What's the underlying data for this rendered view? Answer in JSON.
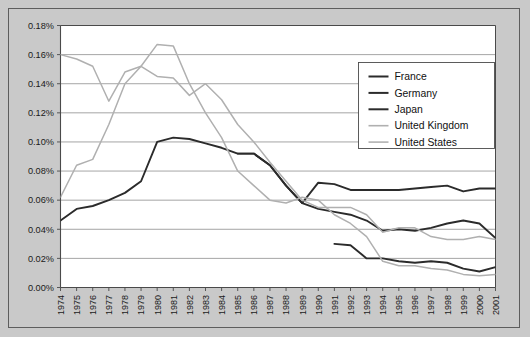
{
  "chart_data": {
    "type": "line",
    "title": "",
    "xlabel": "",
    "ylabel": "",
    "grid": true,
    "legend_position": "top-right",
    "x": [
      1974,
      1975,
      1976,
      1977,
      1978,
      1979,
      1980,
      1981,
      1982,
      1983,
      1984,
      1985,
      1986,
      1987,
      1988,
      1989,
      1990,
      1991,
      1992,
      1993,
      1994,
      1995,
      1996,
      1997,
      1998,
      1999,
      2000,
      2001
    ],
    "xtick_labels": [
      "1974",
      "1975",
      "1976",
      "1977",
      "1978",
      "1979",
      "1980",
      "1981",
      "1982",
      "1983",
      "1984",
      "1985",
      "1986",
      "1987",
      "1988",
      "1989",
      "1990",
      "1991",
      "1992",
      "1993",
      "1994",
      "1995",
      "1996",
      "1997",
      "1998",
      "1999",
      "2000",
      "2001"
    ],
    "ylim": [
      0,
      0.18
    ],
    "ytick_labels": [
      "0.00%",
      "0.02%",
      "0.04%",
      "0.06%",
      "0.08%",
      "0.10%",
      "0.12%",
      "0.14%",
      "0.16%",
      "0.18%"
    ],
    "ytick_values": [
      0.0,
      0.02,
      0.04,
      0.06,
      0.08,
      0.1,
      0.12,
      0.14,
      0.16,
      0.18
    ],
    "unit": "%",
    "series": [
      {
        "name": "France",
        "color": "#2b2b2b",
        "width": 1.9,
        "x": [
          1991,
          1992,
          1993,
          1994,
          1995,
          1996,
          1997,
          1998,
          1999,
          2000,
          2001
        ],
        "values": [
          0.03,
          0.029,
          0.02,
          0.02,
          0.018,
          0.017,
          0.018,
          0.017,
          0.013,
          0.011,
          0.014
        ]
      },
      {
        "name": "Germany",
        "color": "#2b2b2b",
        "width": 1.9,
        "x": [
          1985,
          1986,
          1987,
          1988,
          1989,
          1990,
          1991,
          1992,
          1993,
          1994,
          1995,
          1996,
          1997,
          1998,
          1999,
          2000,
          2001
        ],
        "values": [
          0.092,
          0.092,
          0.084,
          0.07,
          0.058,
          0.072,
          0.071,
          0.067,
          0.067,
          0.067,
          0.067,
          0.068,
          0.069,
          0.07,
          0.066,
          0.068,
          0.068
        ]
      },
      {
        "name": "Japan",
        "color": "#2b2b2b",
        "width": 1.9,
        "x": [
          1974,
          1975,
          1976,
          1977,
          1978,
          1979,
          1980,
          1981,
          1982,
          1983,
          1984,
          1985,
          1986,
          1987,
          1988,
          1989,
          1990,
          1991,
          1992,
          1993,
          1994,
          1995,
          1996,
          1997,
          1998,
          1999,
          2000,
          2001
        ],
        "values": [
          0.046,
          0.054,
          0.056,
          0.06,
          0.065,
          0.073,
          0.1,
          0.103,
          0.102,
          0.099,
          0.096,
          0.092,
          0.092,
          0.084,
          0.07,
          0.058,
          0.054,
          0.052,
          0.05,
          0.046,
          0.039,
          0.04,
          0.039,
          0.041,
          0.044,
          0.046,
          0.044,
          0.034
        ]
      },
      {
        "name": "United Kingdom",
        "color": "#b0b0b0",
        "width": 1.5,
        "x": [
          1974,
          1975,
          1976,
          1977,
          1978,
          1979,
          1980,
          1981,
          1982,
          1983,
          1984,
          1985,
          1986,
          1987,
          1988,
          1989,
          1990,
          1991,
          1992,
          1993,
          1994,
          1995,
          1996,
          1997,
          1998,
          1999,
          2000,
          2001
        ],
        "values": [
          0.062,
          0.084,
          0.088,
          0.112,
          0.14,
          0.152,
          0.167,
          0.166,
          0.14,
          0.12,
          0.103,
          0.08,
          0.07,
          0.06,
          0.058,
          0.062,
          0.06,
          0.05,
          0.044,
          0.035,
          0.018,
          0.015,
          0.015,
          0.013,
          0.012,
          0.009,
          0.008,
          0.009
        ]
      },
      {
        "name": "United States",
        "color": "#b0b0b0",
        "width": 1.5,
        "x": [
          1974,
          1975,
          1976,
          1977,
          1978,
          1979,
          1980,
          1981,
          1982,
          1983,
          1984,
          1985,
          1986,
          1987,
          1988,
          1989,
          1990,
          1991,
          1992,
          1993,
          1994,
          1995,
          1996,
          1997,
          1998,
          1999,
          2000,
          2001
        ],
        "values": [
          0.16,
          0.157,
          0.152,
          0.128,
          0.148,
          0.152,
          0.145,
          0.144,
          0.132,
          0.14,
          0.129,
          0.112,
          0.1,
          0.086,
          0.073,
          0.06,
          0.055,
          0.055,
          0.055,
          0.05,
          0.038,
          0.041,
          0.041,
          0.035,
          0.033,
          0.033,
          0.035,
          0.033
        ]
      }
    ],
    "legend": [
      {
        "label": "France",
        "color": "#2b2b2b",
        "width": 2.0
      },
      {
        "label": "Germany",
        "color": "#2b2b2b",
        "width": 2.0
      },
      {
        "label": "Japan",
        "color": "#2b2b2b",
        "width": 2.0
      },
      {
        "label": "United Kingdom",
        "color": "#b0b0b0",
        "width": 1.6
      },
      {
        "label": "United States",
        "color": "#b0b0b0",
        "width": 1.6
      }
    ]
  },
  "figure": {
    "background_color": "#c9c9c9",
    "plot_background_color": "#ffffff",
    "grid_color": "#8e8e8e",
    "axis_color": "#4a4a4a",
    "border_color": "#5d5d5d"
  }
}
